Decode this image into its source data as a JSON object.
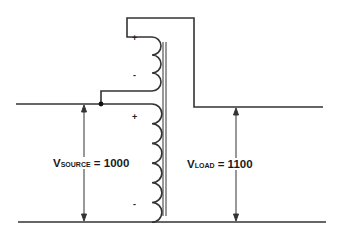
{
  "diagram": {
    "type": "autotransformer-boost-circuit",
    "colors": {
      "wire": "#333333",
      "background": "#ffffff",
      "text": "#1a1a1a"
    },
    "upper_winding": {
      "polarity_top": "+",
      "polarity_bottom": "-",
      "turns": 3
    },
    "lower_winding": {
      "polarity_top": "+",
      "polarity_bottom": "-",
      "turns": 6
    },
    "source_label": {
      "prefix": "V",
      "subscript": "SOURCE",
      "suffix": " = 1000"
    },
    "load_label": {
      "prefix": "V",
      "subscript": "LOAD",
      "suffix": " = 1100"
    }
  }
}
